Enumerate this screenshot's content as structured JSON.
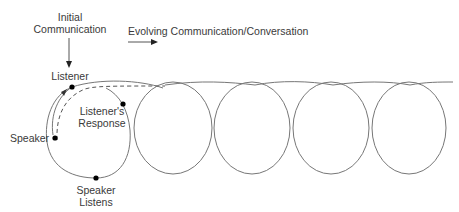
{
  "labels": {
    "initial_line1": "Initial",
    "initial_line2": "Communication",
    "evolving": "Evolving Communication/Conversation",
    "listener": "Listener",
    "response_line1": "Listener's",
    "response_line2": "Response",
    "speaker": "Speaker",
    "listens_line1": "Speaker",
    "listens_line2": "Listens"
  },
  "colors": {
    "line": "#777777",
    "dot": "#000000",
    "text": "#3a3a3a"
  },
  "loops": {
    "count": 5,
    "spacing": 79
  }
}
